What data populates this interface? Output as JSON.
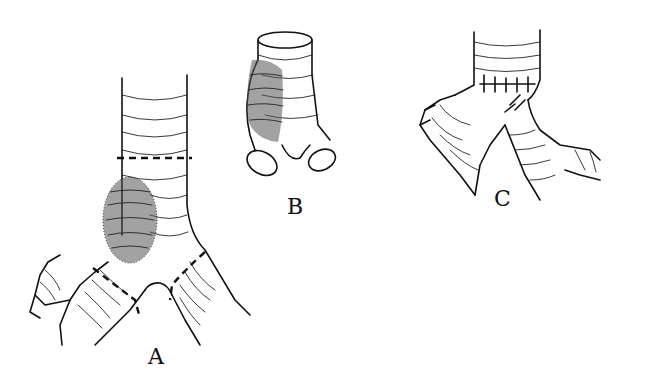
{
  "figure": {
    "panels": [
      {
        "id": "A",
        "label": "A",
        "description": "trachea and carina with tumor, dashed resection lines"
      },
      {
        "id": "B",
        "label": "B",
        "description": "resected carinal segment with tumor"
      },
      {
        "id": "C",
        "label": "C",
        "description": "reconstruction with sutured anastomosis"
      }
    ]
  }
}
